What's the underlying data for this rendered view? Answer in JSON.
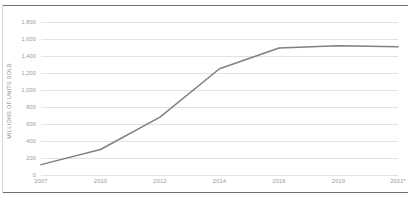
{
  "chart_data": {
    "type": "line",
    "title": "",
    "xlabel": "",
    "ylabel": "MILLIONS OF UNITS SOLD",
    "categories": [
      "2007",
      "2010",
      "2012",
      "2014",
      "2016",
      "2019",
      "2021*"
    ],
    "x_tick_labels": [
      "2007",
      "2010",
      "2012",
      "2014",
      "2016",
      "2019",
      "2021*"
    ],
    "y_tick_labels": [
      "0",
      "200",
      "400",
      "600",
      "800",
      "1,000",
      "1,200",
      "1,400",
      "1,600",
      "1,800"
    ],
    "y_tick_values": [
      0,
      200,
      400,
      600,
      800,
      1000,
      1200,
      1400,
      1600,
      1800
    ],
    "values": [
      122,
      300,
      680,
      1250,
      1495,
      1520,
      1510
    ],
    "series": [
      {
        "name": "Units sold",
        "values": [
          122,
          300,
          680,
          1250,
          1495,
          1520,
          1510
        ]
      }
    ],
    "ylim": [
      0,
      1800
    ],
    "grid": "horizontal",
    "legend": "none",
    "line_color": "#808080",
    "gridline_color": "#e2e2e2",
    "tick_label_color": "#9a9a9a",
    "axis_title_color": "#8e8e8e",
    "border_color": "#6f6f6f",
    "markers": "none",
    "footnote_marker": "*"
  }
}
